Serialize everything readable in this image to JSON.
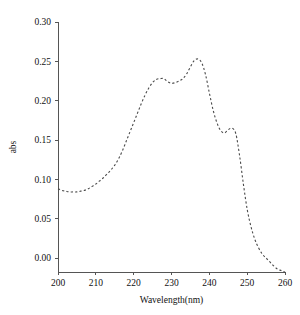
{
  "chart_data": {
    "type": "line",
    "title": "",
    "subtitle": "",
    "xlabel": "Wavelength(nm)",
    "ylabel": "abs",
    "xlim": [
      200,
      260
    ],
    "ylim": [
      -0.025,
      0.3
    ],
    "xticks": [
      200,
      210,
      220,
      230,
      240,
      250,
      260
    ],
    "xtick_labels": [
      "200",
      "210",
      "220",
      "230",
      "240",
      "250",
      "260"
    ],
    "yticks": [
      0.0,
      0.05,
      0.1,
      0.15,
      0.2,
      0.25,
      0.3
    ],
    "ytick_labels": [
      "0.00",
      "0.05",
      "0.10",
      "0.15",
      "0.20",
      "0.25",
      "0.30"
    ],
    "grid": false,
    "legend": null,
    "legend_position": "none",
    "line_style": "dashed",
    "line_color": "#4a4a4a",
    "axis_color": "#555555",
    "background_color": "#ffffff",
    "series": [
      {
        "name": "abs",
        "x": [
          200,
          201,
          202,
          203,
          204,
          205,
          206,
          207,
          208,
          209,
          210,
          211,
          212,
          213,
          214,
          215,
          216,
          217,
          218,
          219,
          220,
          221,
          222,
          223,
          224,
          225,
          226,
          227,
          228,
          229,
          230,
          231,
          232,
          233,
          234,
          235,
          236,
          237,
          238,
          239,
          240,
          241,
          242,
          243,
          244,
          245,
          246,
          247,
          248,
          249,
          250,
          251,
          252,
          253,
          254,
          255,
          256,
          257,
          258,
          259,
          260
        ],
        "y": [
          0.088,
          0.086,
          0.085,
          0.084,
          0.084,
          0.084,
          0.085,
          0.086,
          0.088,
          0.091,
          0.094,
          0.098,
          0.102,
          0.107,
          0.112,
          0.118,
          0.126,
          0.136,
          0.148,
          0.16,
          0.172,
          0.184,
          0.196,
          0.207,
          0.216,
          0.223,
          0.227,
          0.228,
          0.228,
          0.224,
          0.222,
          0.223,
          0.225,
          0.228,
          0.234,
          0.243,
          0.251,
          0.253,
          0.248,
          0.233,
          0.21,
          0.188,
          0.172,
          0.162,
          0.159,
          0.163,
          0.165,
          0.158,
          0.13,
          0.094,
          0.062,
          0.04,
          0.024,
          0.013,
          0.005,
          0.0,
          -0.005,
          -0.01,
          -0.014,
          -0.016,
          -0.018
        ]
      }
    ],
    "annotations": [
      {
        "label": "shoulder peak",
        "x": 228,
        "y": 0.228
      },
      {
        "label": "main peak",
        "x": 237,
        "y": 0.253
      },
      {
        "label": "secondary shoulder",
        "x": 245,
        "y": 0.165
      }
    ]
  }
}
